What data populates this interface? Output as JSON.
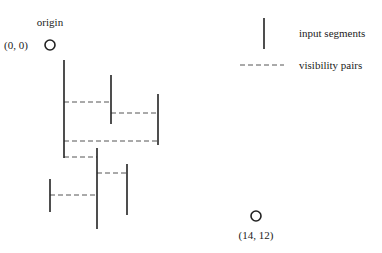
{
  "diagram": {
    "colors": {
      "segment": "#222222",
      "dash": "#555555",
      "circle": "#222222",
      "text": "#222222"
    },
    "origin": {
      "label": "origin",
      "coord_label": "(0, 0)",
      "cx": 50,
      "cy": 45,
      "r": 5
    },
    "target": {
      "coord_label": "(14, 12)",
      "cx": 256,
      "cy": 216,
      "r": 5
    },
    "legend": {
      "segment_label": "input segments",
      "pairs_label": "visibility pairs"
    },
    "segments": [
      {
        "id": "s1",
        "x": 64,
        "y1": 60,
        "y2": 158
      },
      {
        "id": "s2",
        "x": 111,
        "y1": 75,
        "y2": 124
      },
      {
        "id": "s3",
        "x": 158,
        "y1": 94,
        "y2": 145
      },
      {
        "id": "s4",
        "x": 97,
        "y1": 148,
        "y2": 229
      },
      {
        "id": "s5",
        "x": 127,
        "y1": 164,
        "y2": 215
      },
      {
        "id": "s6",
        "x": 50,
        "y1": 179,
        "y2": 212
      }
    ],
    "pairs": [
      {
        "from": "s1",
        "to": "s2",
        "x1": 64,
        "x2": 111,
        "y": 102
      },
      {
        "from": "s2",
        "to": "s3",
        "x1": 111,
        "x2": 158,
        "y": 113
      },
      {
        "from": "s1",
        "to": "s3",
        "x1": 64,
        "x2": 158,
        "y": 141
      },
      {
        "from": "s1",
        "to": "s4",
        "x1": 64,
        "x2": 97,
        "y": 157
      },
      {
        "from": "s4",
        "to": "s5",
        "x1": 97,
        "x2": 127,
        "y": 173
      },
      {
        "from": "s6",
        "to": "s4",
        "x1": 50,
        "x2": 97,
        "y": 195
      }
    ]
  }
}
